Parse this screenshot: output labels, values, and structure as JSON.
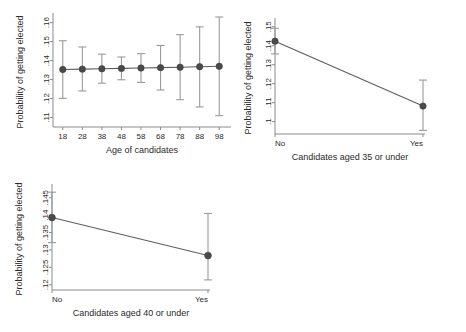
{
  "figure": {
    "ylabel": "Probability of getting elected",
    "panel_count": 3
  },
  "chart_data": [
    {
      "id": "age",
      "type": "line",
      "title": "",
      "xlabel": "Age of candidates",
      "ylabel": "Probability of getting elected",
      "x": [
        18,
        28,
        38,
        48,
        58,
        68,
        78,
        88,
        98
      ],
      "xticklabels": [
        "18",
        "28",
        "38",
        "48",
        "58",
        "68",
        "78",
        "88",
        "98"
      ],
      "xlim": [
        13,
        103
      ],
      "ylim": [
        0.105,
        0.163
      ],
      "yticks": [
        0.11,
        0.12,
        0.13,
        0.14,
        0.15,
        0.16
      ],
      "yticklabels": [
        ".11",
        ".12",
        ".13",
        ".14",
        ".15",
        ".16"
      ],
      "grid": false,
      "legend": "none",
      "series": [
        {
          "name": "Predicted probability",
          "values": [
            0.1353,
            0.1355,
            0.1357,
            0.1359,
            0.1361,
            0.1363,
            0.1365,
            0.1368,
            0.137
          ],
          "ci_low": [
            0.1201,
            0.124,
            0.1281,
            0.1299,
            0.1285,
            0.1245,
            0.1194,
            0.1156,
            0.111
          ],
          "ci_high": [
            0.1505,
            0.1472,
            0.1434,
            0.1419,
            0.1437,
            0.148,
            0.1537,
            0.1578,
            0.163
          ]
        }
      ]
    },
    {
      "id": "age35",
      "type": "line",
      "title": "",
      "xlabel": "Candidates aged 35 or under",
      "ylabel": "Probability of getting elected",
      "x": [
        "No",
        "Yes"
      ],
      "xticklabels": [
        "No",
        "Yes"
      ],
      "ylim": [
        0.0935,
        0.1525
      ],
      "yticks": [
        0.1,
        0.11,
        0.12,
        0.13,
        0.14,
        0.15
      ],
      "yticklabels": [
        ".1",
        ".11",
        ".12",
        ".13",
        ".14",
        ".15"
      ],
      "grid": false,
      "legend": "none",
      "series": [
        {
          "name": "Predicted probability",
          "values": [
            0.1424,
            0.1082
          ],
          "ci_low": [
            0.1357,
            0.0954
          ],
          "ci_high": [
            0.1492,
            0.1219
          ]
        }
      ]
    },
    {
      "id": "age40",
      "type": "line",
      "title": "",
      "xlabel": "Candidates aged 40 or under",
      "ylabel": "Probability of getting elected",
      "x": [
        "No",
        "Yes"
      ],
      "xticklabels": [
        "No",
        "Yes"
      ],
      "ylim": [
        0.1185,
        0.1478
      ],
      "yticks": [
        0.12,
        0.125,
        0.13,
        0.135,
        0.14,
        0.145
      ],
      "yticklabels": [
        ".12",
        ".125",
        ".13",
        ".135",
        ".14",
        ".145"
      ],
      "grid": false,
      "legend": "none",
      "series": [
        {
          "name": "Predicted probability",
          "values": [
            0.1393,
            0.1284
          ],
          "ci_low": [
            0.1321,
            0.1214
          ],
          "ci_high": [
            0.1466,
            0.1405
          ]
        }
      ]
    }
  ],
  "colors": {
    "marker": "#4a4a4a",
    "line": "#5e5e5e",
    "ci": "#9a9a9a",
    "axis": "#8b8b8b",
    "text": "#2b2b2b",
    "background": "#ffffff"
  }
}
